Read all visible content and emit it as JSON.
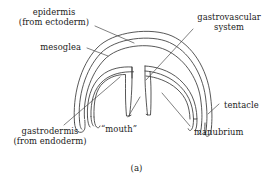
{
  "figure": {
    "caption": "(a)",
    "colors": {
      "background": "#ffffff",
      "outline_stroke": "#3a3a3a",
      "leader_stroke": "#4a4a4a",
      "text": "#1a1a1a"
    }
  },
  "labels": {
    "epidermis": {
      "line1": "epidermis",
      "line2": "(from ectoderm)"
    },
    "mesoglea": {
      "line1": "mesoglea"
    },
    "gastrovascular": {
      "line1": "gastrovascular",
      "line2": "system"
    },
    "tentacle": {
      "line1": "tentacle"
    },
    "manubrium": {
      "line1": "manubrium"
    },
    "mouth": {
      "line1": "“mouth”"
    },
    "gastrodermis": {
      "line1": "gastrodermis",
      "line2": "(from endoderm)"
    }
  }
}
